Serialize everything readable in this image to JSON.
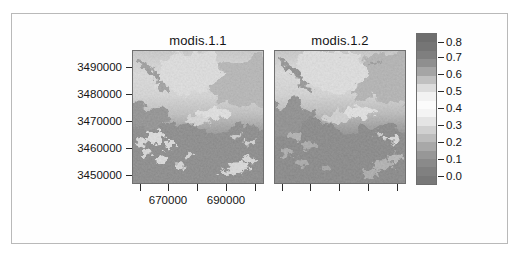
{
  "figure": {
    "width": 522,
    "height": 260,
    "background": "#ffffff",
    "frame_color": "#b9b9b9"
  },
  "panels": [
    {
      "id": "modis-1-1",
      "title": "modis.1.1",
      "x_axis": {
        "tick_values": [
          660000,
          670000,
          680000,
          690000,
          700000
        ],
        "tick_labels": [
          "",
          "670000",
          "",
          "690000",
          ""
        ],
        "labelled": [
          "670000",
          "690000"
        ]
      },
      "y_axis": {
        "tick_values": [
          3450000,
          3460000,
          3470000,
          3480000,
          3490000
        ],
        "tick_labels": [
          "3450000",
          "3460000",
          "3470000",
          "3480000",
          "3490000"
        ]
      }
    },
    {
      "id": "modis-1-2",
      "title": "modis.1.2",
      "x_axis": {
        "tick_values": [
          660000,
          670000,
          680000,
          690000,
          700000
        ],
        "tick_labels": [
          "",
          "",
          "",
          "",
          ""
        ],
        "labelled": []
      },
      "y_axis": {
        "tick_values": [
          3450000,
          3460000,
          3470000,
          3480000,
          3490000
        ],
        "tick_labels": [
          "",
          "",
          "",
          "",
          ""
        ]
      }
    }
  ],
  "colorkey": {
    "orientation": "vertical",
    "tick_labels": [
      "0.8",
      "0.7",
      "0.6",
      "0.5",
      "0.4",
      "0.3",
      "0.2",
      "0.1",
      "0.0"
    ],
    "tick_values": [
      0.8,
      0.7,
      0.6,
      0.5,
      0.4,
      0.3,
      0.2,
      0.1,
      0.0
    ],
    "range": [
      -0.05,
      0.85
    ],
    "ramp_top_to_bottom": [
      "#6e6e6e",
      "#757575",
      "#7f7f7f",
      "#8f8f8f",
      "#a5a5a5",
      "#c0c0c0",
      "#dcdcdc",
      "#f2f2f2",
      "#fbfbfb",
      "#f4f4f4",
      "#e4e4e4",
      "#d0d0d0",
      "#bcbcbc",
      "#a8a8a8",
      "#979797",
      "#8a8a8a",
      "#808080",
      "#787878"
    ]
  },
  "chart_data": {
    "type": "heatmap",
    "title": "",
    "subtitle": "",
    "xlabel": "",
    "ylabel": "",
    "grid": false,
    "legend_position": "right",
    "panel_titles": [
      "modis.1.1",
      "modis.1.2"
    ],
    "x_tick_labels": [
      "670000",
      "690000"
    ],
    "y_tick_labels": [
      "3450000",
      "3460000",
      "3470000",
      "3480000",
      "3490000"
    ],
    "xlim": [
      658000,
      702000
    ],
    "ylim": [
      3444000,
      3494000
    ],
    "zlim": [
      0.0,
      0.85
    ],
    "colorbar_ticks": [
      0.0,
      0.1,
      0.2,
      0.3,
      0.4,
      0.5,
      0.6,
      0.7,
      0.8
    ],
    "colormap": "grayscale-diverging",
    "series": [
      {
        "name": "modis.1.1",
        "summary": "Upper half bright (values 0.35-0.55), lower half dark (values 0.05-0.2), scattered bright patches near y=3455000-3465000, a bright lens near (685000, 3470000)."
      },
      {
        "name": "modis.1.2",
        "summary": "Same spatial pattern as modis.1.1 with slightly coarser / darker lower-left region and a sharper bright lens near (686000, 3470000)."
      }
    ]
  }
}
